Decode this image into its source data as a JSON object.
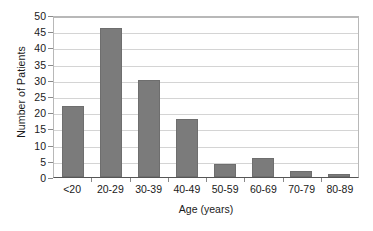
{
  "chart_data": {
    "type": "bar",
    "title": "",
    "xlabel": "Age (years)",
    "ylabel": "Number of Patients",
    "categories": [
      "<20",
      "20-29",
      "30-39",
      "40-49",
      "50-59",
      "60-69",
      "70-79",
      "80-89"
    ],
    "values": [
      22,
      46,
      30,
      18,
      4,
      6,
      2,
      1
    ],
    "series": [
      {
        "name": "Number of Patients",
        "values": [
          22,
          46,
          30,
          18,
          4,
          6,
          2,
          1
        ]
      }
    ],
    "ylim": [
      0,
      50
    ],
    "xlim_categorical": true,
    "y_ticks": [
      0,
      5,
      10,
      15,
      20,
      25,
      30,
      35,
      40,
      45,
      50
    ],
    "y_tick_labels": [
      "0",
      "5",
      "10",
      "15",
      "20",
      "25",
      "30",
      "35",
      "40",
      "45",
      "50"
    ],
    "grid": "horizontal",
    "legend": "none",
    "bar_color": "#7b7b7b",
    "gridline_color": "#d4d4d4",
    "axis_color": "#555555",
    "plot_border_color": "#b8b8b8",
    "text_color": "#1a1a1a",
    "background_color": "#ffffff"
  }
}
